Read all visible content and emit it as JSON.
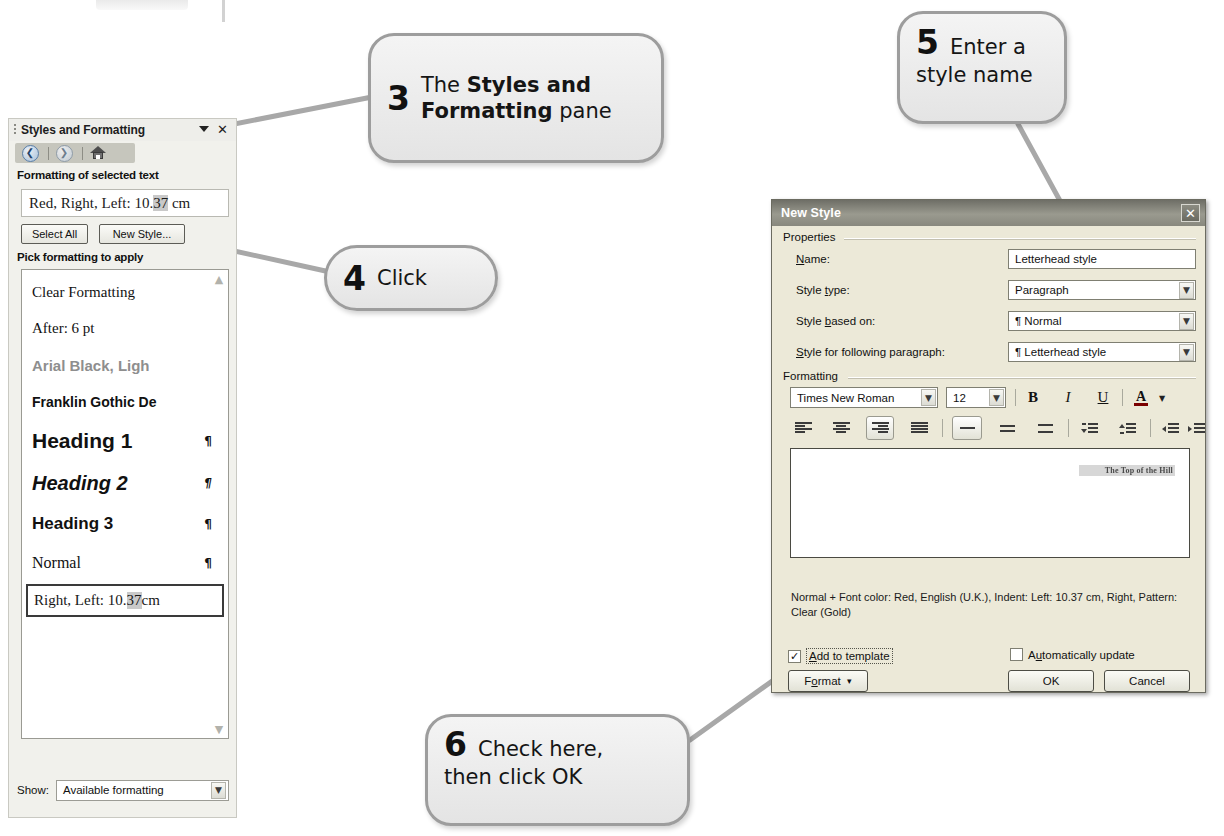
{
  "styles_pane": {
    "title": "Styles and Formatting",
    "menu_arrow_icon": "chevron-down-icon",
    "close_icon": "close-icon",
    "nav": {
      "back_icon": "back-arrow-icon",
      "forward_icon": "forward-arrow-icon",
      "home_icon": "home-icon"
    },
    "formatting_of_selected_text_label": "Formatting of selected text",
    "selected_format": {
      "prefix": "Red, Right, Left:  10.",
      "highlight": "37",
      "suffix": " cm"
    },
    "select_all_label": "Select All",
    "new_style_label": "New Style...",
    "pick_formatting_label": "Pick formatting to apply",
    "style_items": [
      {
        "label": "Clear Formatting",
        "pilcrow": ""
      },
      {
        "label": "After:  6 pt",
        "pilcrow": ""
      },
      {
        "label": "Arial Black, Ligh",
        "pilcrow": ""
      },
      {
        "label": "Franklin Gothic De",
        "pilcrow": ""
      },
      {
        "label": "Heading 1",
        "pilcrow": "¶"
      },
      {
        "label": "Heading 2",
        "pilcrow": "¶"
      },
      {
        "label": "Heading 3",
        "pilcrow": "¶"
      },
      {
        "label": "Normal",
        "pilcrow": "¶"
      }
    ],
    "selected_style": {
      "prefix": "Right, Left:  10.",
      "highlight": "37",
      "suffix": " cm"
    },
    "scroll_up_icon": "chevron-up-icon",
    "scroll_down_icon": "chevron-down-icon",
    "show_label": "Show:",
    "show_value": "Available formatting",
    "show_arrow_icon": "chevron-down-icon"
  },
  "new_style_dialog": {
    "title": "New Style",
    "close_icon": "close-icon",
    "properties_legend": "Properties",
    "fields": {
      "name_label_pre": "N",
      "name_label_acc": "a",
      "name_label_post": "me:",
      "name_value": "Letterhead style",
      "style_type_label_pre": "Style ",
      "style_type_label_acc": "t",
      "style_type_label_post": "ype:",
      "style_type_value": "Paragraph",
      "style_based_on_label_pre": "Style ",
      "style_based_on_label_acc": "b",
      "style_based_on_label_post": "ased on:",
      "style_based_on_value": "¶ Normal",
      "style_following_label_pre": "",
      "style_following_label_acc": "S",
      "style_following_label_post": "tyle for following paragraph:",
      "style_following_value": "¶ Letterhead style"
    },
    "formatting_legend": "Formatting",
    "font_family_value": "Times New Roman",
    "font_size_value": "12",
    "bold_glyph": "B",
    "italic_glyph": "I",
    "underline_glyph": "U",
    "font_color_glyph": "A",
    "toolbar_icons": {
      "align_left": "align-left-icon",
      "align_center": "align-center-icon",
      "align_right": "align-right-icon",
      "align_justify": "align-justify-icon",
      "line_spacing_single": "line-spacing-single-icon",
      "line_spacing_1_5": "line-spacing-1-5-icon",
      "line_spacing_double": "line-spacing-double-icon",
      "decrease_spacing": "decrease-paragraph-spacing-icon",
      "increase_spacing": "increase-paragraph-spacing-icon",
      "decrease_indent": "decrease-indent-icon",
      "increase_indent": "increase-indent-icon"
    },
    "preview_text": "The Top of the Hill",
    "description": "Normal + Font color: Red, English (U.K.), Indent: Left:  10.37 cm, Right, Pattern: Clear (Gold)",
    "add_to_template": {
      "label_pre": "",
      "label_acc": "A",
      "label_post": "dd to template",
      "checked": true,
      "check_glyph": "✓"
    },
    "automatically_update": {
      "label_pre": "A",
      "label_acc": "u",
      "label_post": "tomatically update",
      "checked": false
    },
    "format_button_pre": "F",
    "format_button_acc": "o",
    "format_button_post": "rmat",
    "format_button_arrow": "▾",
    "ok_label": "OK",
    "cancel_label": "Cancel"
  },
  "callouts": {
    "three": {
      "number": "3",
      "text_pre": "The ",
      "text_bold": "Styles and Formatting",
      "text_post": " pane"
    },
    "four": {
      "number": "4",
      "text": "Click"
    },
    "five": {
      "number": "5",
      "text_line1": "Enter a",
      "text_line2": "style name"
    },
    "six": {
      "number": "6",
      "text_line1": "Check here,",
      "text_line2": "then click OK"
    }
  },
  "colors": {
    "pane_background": "#f1f1ec",
    "dialog_background": "#ece9d8",
    "titlebar": "#8a8a80",
    "callout_border": "#9d9d9d",
    "highlight_gray": "#c9c9c9"
  }
}
